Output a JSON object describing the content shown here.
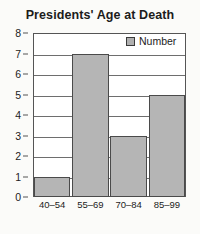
{
  "chart_data": {
    "type": "bar",
    "title": "Presidents' Age at Death",
    "categories": [
      "40–54",
      "55–69",
      "70–84",
      "85–99"
    ],
    "values": [
      1,
      7,
      3,
      5
    ],
    "series": [
      {
        "name": "Number",
        "values": [
          1,
          7,
          3,
          5
        ]
      }
    ],
    "xlabel": "",
    "ylabel": "",
    "ylim": [
      0,
      8
    ],
    "ytick_step": 1,
    "yticks": [
      "0",
      "1",
      "2",
      "3",
      "4",
      "5",
      "6",
      "7",
      "8"
    ],
    "grid": true,
    "legend": {
      "position": "top-right",
      "entries": [
        {
          "label": "Number",
          "color": "#b5b5b5"
        }
      ]
    },
    "colors": {
      "bar_fill": "#b5b5b5",
      "bar_border": "#4a4a4a",
      "grid": "#6e6e6e",
      "axis": "#555555",
      "text": "#1c1c1c",
      "background": "#fbfbf9",
      "plot_background": "#ffffff"
    }
  }
}
